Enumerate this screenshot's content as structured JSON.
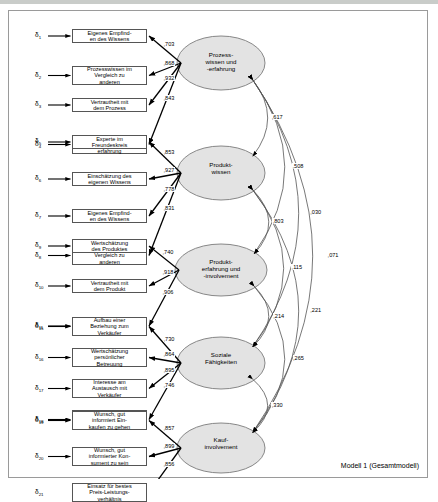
{
  "figure": {
    "caption": "Modell 1 (Gesamtmodell)",
    "border_color": "#9a9a9a",
    "ellipse_fill": "#e3e3e3",
    "box_border": "#555555"
  },
  "constructs": [
    {
      "id": "prozesswissen",
      "label": "Prozess-\nwissen und\n-erfahrung",
      "cx": 212,
      "cy": 52,
      "rx": 44,
      "ry": 27,
      "indicators": [
        {
          "delta": "1",
          "text": "Eigenes Empfind-\nen des Wissens",
          "loading": ",703"
        },
        {
          "delta": "2",
          "text": "Prozesswissen im\nVergleich zu\nanderen",
          "loading": ",868"
        },
        {
          "delta": "3",
          "text": "Vertrautheit mit\ndem Prozess",
          "loading": ",932"
        },
        {
          "delta": "4",
          "text": "Wissen durch\nProzess-\nerfahrung",
          "loading": ",843"
        }
      ]
    },
    {
      "id": "produktwissen",
      "label": "Produkt-\nwissen",
      "cx": 212,
      "cy": 162,
      "rx": 44,
      "ry": 27,
      "indicators": [
        {
          "delta": "5",
          "text": "Experte im\nFreundeskreis",
          "loading": ",853"
        },
        {
          "delta": "6",
          "text": "Einschätzung des\neigenen Wissens",
          "loading": ",927"
        },
        {
          "delta": "7",
          "text": "Eigenes Empfind-\nen des Wissens",
          "loading": ",778"
        },
        {
          "delta": "8",
          "text": "Produktwissen im\nVergleich zu\nanderen",
          "loading": ",831"
        }
      ]
    },
    {
      "id": "produkterfahrung",
      "label": "Produkt-\nerfahrung und\n-involvement",
      "cx": 212,
      "cy": 259,
      "rx": 46,
      "ry": 26,
      "indicators": [
        {
          "delta": "9",
          "text": "Wertschätzung\ndes Produktes",
          "loading": ",740"
        },
        {
          "delta": "10",
          "text": "Vertrautheit mit\ndem Produkt",
          "loading": ",918"
        },
        {
          "delta": "11",
          "text": "Erfahrung mit\ndem Produkt",
          "loading": ",906"
        }
      ]
    },
    {
      "id": "soziale",
      "label": "Soziale\nFähigkeiten",
      "cx": 212,
      "cy": 352,
      "rx": 44,
      "ry": 26,
      "indicators": [
        {
          "delta": "15",
          "text": "Aufbau einer\nBeziehung zum\nVerkäufer",
          "loading": ",730"
        },
        {
          "delta": "16",
          "text": "Wertschätzung\npersönlicher\nBetreuung",
          "loading": ",864"
        },
        {
          "delta": "17",
          "text": "Interesse am\nAustausch mit\nVerkäufer",
          "loading": ",895"
        },
        {
          "delta": "18",
          "text": "Wichtigkeit\npersönlicher\nBetreuung",
          "loading": ",746"
        }
      ]
    },
    {
      "id": "kaufinvolvement",
      "label": "Kauf-\ninvolvement",
      "cx": 212,
      "cy": 437,
      "rx": 44,
      "ry": 25,
      "indicators": [
        {
          "delta": "19",
          "text": "Wunsch, gut\ninformiert Ein-\nkaufen zu gehen",
          "loading": ",857"
        },
        {
          "delta": "20",
          "text": "Wunsch, gut\ninformierter Kon-\nsument zu sein",
          "loading": ",899"
        },
        {
          "delta": "21",
          "text": "Einsatz für bestes\nPreis-Leistungs-\nverhältnis",
          "loading": ",856"
        }
      ]
    }
  ],
  "correlations": [
    {
      "from": "prozesswissen",
      "to": "produktwissen",
      "value": ",617"
    },
    {
      "from": "prozesswissen",
      "to": "produkterfahrung",
      "value": ",508"
    },
    {
      "from": "prozesswissen",
      "to": "soziale",
      "value": ",030"
    },
    {
      "from": "prozesswissen",
      "to": "kaufinvolvement",
      "value": ",071"
    },
    {
      "from": "produktwissen",
      "to": "produkterfahrung",
      "value": ",803"
    },
    {
      "from": "produktwissen",
      "to": "soziale",
      "value": ",115"
    },
    {
      "from": "produktwissen",
      "to": "kaufinvolvement",
      "value": ",221"
    },
    {
      "from": "produkterfahrung",
      "to": "soziale",
      "value": ",214"
    },
    {
      "from": "produkterfahrung",
      "to": "kaufinvolvement",
      "value": ",265"
    },
    {
      "from": "soziale",
      "to": "kaufinvolvement",
      "value": ",330"
    }
  ]
}
